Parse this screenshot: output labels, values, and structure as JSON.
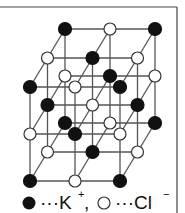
{
  "figure": {
    "lattice_size": [
      3,
      3,
      3
    ],
    "site_rule": "black when (i+j+k) is even, white otherwise",
    "colors": {
      "line": "#555555",
      "border": "#444444",
      "black_ion": "#111111",
      "white_ion": "#ffffff"
    }
  },
  "legend": {
    "black_marker": "black-circle",
    "black_label": "···K",
    "black_charge": "+",
    "separator": ",",
    "white_marker": "white-circle",
    "white_label": "···Cl",
    "white_charge": "−"
  }
}
